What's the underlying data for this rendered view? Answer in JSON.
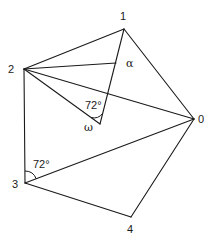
{
  "diagram": {
    "type": "geometric-construction",
    "vertices": [
      {
        "id": "0",
        "label": "0",
        "x": 194,
        "y": 119
      },
      {
        "id": "1",
        "label": "1",
        "x": 124,
        "y": 29
      },
      {
        "id": "2",
        "label": "2",
        "x": 24,
        "y": 69
      },
      {
        "id": "3",
        "label": "3",
        "x": 25,
        "y": 183
      },
      {
        "id": "4",
        "label": "4",
        "x": 131,
        "y": 217
      },
      {
        "id": "alpha",
        "label": "α",
        "x": 116,
        "y": 63
      },
      {
        "id": "omega",
        "label": "ω",
        "x": 100,
        "y": 124
      }
    ],
    "angles": [
      {
        "at": "omega",
        "label": "72°"
      },
      {
        "at": "3",
        "label": "72°"
      }
    ]
  }
}
